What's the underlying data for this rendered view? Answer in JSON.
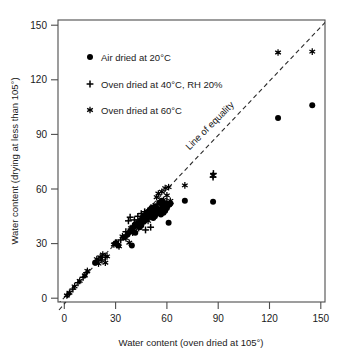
{
  "chart_data": {
    "type": "scatter",
    "title": "",
    "xlabel": "Water content (oven dried at 105°)",
    "ylabel": "Water content (drying at less than 105°)",
    "xlim": [
      0,
      150
    ],
    "ylim": [
      0,
      150
    ],
    "xticks": [
      0,
      30,
      60,
      90,
      120,
      150
    ],
    "yticks": [
      0,
      30,
      60,
      90,
      120,
      150
    ],
    "xtick_labels": [
      "0",
      "30",
      "60",
      "90",
      "120",
      "150"
    ],
    "ytick_labels": [
      "0",
      "30",
      "60",
      "90",
      "120",
      "150"
    ],
    "grid": false,
    "legend_position": "upper-left inside",
    "annotations": [
      {
        "text": "Line of equality",
        "x": 86,
        "y": 97,
        "rotation": -45,
        "name": "line-of-equality-label"
      }
    ],
    "reference_line": {
      "name": "line-of-equality",
      "style": "dashed",
      "from": [
        -4,
        -4
      ],
      "to": [
        152,
        152
      ],
      "label": "Line of equality"
    },
    "series": [
      {
        "name": "Air dried at 20°C",
        "marker": "filled-circle",
        "color": "#000000",
        "points": [
          [
            18,
            19.5
          ],
          [
            30,
            30.0
          ],
          [
            31.5,
            29.0
          ],
          [
            35,
            33.5
          ],
          [
            37,
            35.0
          ],
          [
            38.5,
            36.5
          ],
          [
            39.5,
            29.0
          ],
          [
            40,
            38.0
          ],
          [
            41,
            39.5
          ],
          [
            41.5,
            36.0
          ],
          [
            42,
            40.5
          ],
          [
            43,
            41.0
          ],
          [
            44,
            39.0
          ],
          [
            44.5,
            42.5
          ],
          [
            45,
            40.0
          ],
          [
            45.5,
            43.5
          ],
          [
            46,
            44.5
          ],
          [
            46.5,
            42.0
          ],
          [
            47,
            45.5
          ],
          [
            47.5,
            43.0
          ],
          [
            48,
            46.5
          ],
          [
            48.5,
            44.0
          ],
          [
            49,
            47.5
          ],
          [
            49.5,
            45.0
          ],
          [
            50,
            48.5
          ],
          [
            50.5,
            46.0
          ],
          [
            51,
            49.5
          ],
          [
            51.5,
            47.0
          ],
          [
            52,
            44.0
          ],
          [
            52.5,
            48.0
          ],
          [
            53,
            45.0
          ],
          [
            53.5,
            50.5
          ],
          [
            54,
            46.5
          ],
          [
            54.5,
            49.0
          ],
          [
            55,
            47.5
          ],
          [
            55.5,
            52.5
          ],
          [
            56,
            48.5
          ],
          [
            56.5,
            46.0
          ],
          [
            57,
            53.5
          ],
          [
            57.5,
            50.0
          ],
          [
            58,
            47.0
          ],
          [
            58.5,
            51.5
          ],
          [
            59,
            48.0
          ],
          [
            59.5,
            52.0
          ],
          [
            60,
            49.5
          ],
          [
            60.5,
            51.0
          ],
          [
            61,
            41.5
          ],
          [
            61.5,
            51.5
          ],
          [
            62,
            52.0
          ],
          [
            70.5,
            53.5
          ],
          [
            87,
            53.0
          ],
          [
            125,
            99.0
          ],
          [
            145,
            106.0
          ]
        ]
      },
      {
        "name": "Oven dried at 40°C, RH 20%",
        "marker": "plus",
        "color": "#000000",
        "points": [
          [
            2,
            2.0
          ],
          [
            5,
            5.0
          ],
          [
            8,
            8.5
          ],
          [
            11,
            11.5
          ],
          [
            13,
            14.0
          ],
          [
            20,
            20.5
          ],
          [
            22,
            21.0
          ],
          [
            24,
            22.5
          ],
          [
            30,
            30.5
          ],
          [
            33,
            32.0
          ],
          [
            36,
            36.5
          ],
          [
            37.5,
            42.5
          ],
          [
            38.5,
            44.5
          ],
          [
            39,
            38.0
          ],
          [
            40,
            39.5
          ],
          [
            41,
            43.0
          ],
          [
            42,
            41.5
          ],
          [
            43,
            45.0
          ],
          [
            44,
            42.0
          ],
          [
            45,
            46.5
          ],
          [
            46,
            43.5
          ],
          [
            47,
            47.5
          ],
          [
            47.5,
            37.5
          ],
          [
            48,
            44.5
          ],
          [
            49,
            48.0
          ],
          [
            50,
            45.5
          ],
          [
            50.5,
            39.0
          ],
          [
            51,
            49.0
          ],
          [
            52,
            46.5
          ],
          [
            53,
            50.0
          ],
          [
            54,
            47.0
          ],
          [
            55,
            48.5
          ],
          [
            56,
            51.5
          ],
          [
            57,
            49.5
          ],
          [
            58,
            52.5
          ],
          [
            59,
            50.5
          ],
          [
            60,
            53.0
          ],
          [
            61,
            51.0
          ],
          [
            62,
            52.0
          ],
          [
            87,
            66.5
          ],
          [
            87.2,
            68.5
          ]
        ]
      },
      {
        "name": "Oven dried at 60°C",
        "marker": "asterisk",
        "color": "#000000",
        "points": [
          [
            1.5,
            1.5
          ],
          [
            3,
            3.0
          ],
          [
            6,
            6.5
          ],
          [
            9,
            9.5
          ],
          [
            12,
            12.5
          ],
          [
            13.5,
            15.0
          ],
          [
            19,
            21.5
          ],
          [
            20,
            19.0
          ],
          [
            21,
            22.5
          ],
          [
            22.5,
            24.0
          ],
          [
            24,
            19.5
          ],
          [
            25,
            23.0
          ],
          [
            29,
            29.5
          ],
          [
            30.5,
            30.5
          ],
          [
            32,
            28.5
          ],
          [
            34,
            34.0
          ],
          [
            36,
            33.0
          ],
          [
            38,
            30.5
          ],
          [
            39,
            38.5
          ],
          [
            40,
            36.0
          ],
          [
            42,
            40.0
          ],
          [
            43.5,
            38.5
          ],
          [
            45,
            41.0
          ],
          [
            46,
            43.0
          ],
          [
            48,
            45.0
          ],
          [
            49,
            42.5
          ],
          [
            50,
            46.5
          ],
          [
            51,
            48.0
          ],
          [
            52,
            50.5
          ],
          [
            53,
            47.0
          ],
          [
            54,
            55.5
          ],
          [
            55,
            57.5
          ],
          [
            56,
            52.5
          ],
          [
            57,
            58.5
          ],
          [
            58,
            54.0
          ],
          [
            59,
            60.5
          ],
          [
            60,
            56.5
          ],
          [
            61,
            61.0
          ],
          [
            62,
            53.5
          ],
          [
            70.5,
            62.0
          ],
          [
            87,
            67.5
          ],
          [
            125,
            135.0
          ],
          [
            145,
            135.5
          ]
        ]
      }
    ]
  },
  "legend": {
    "name": "legend",
    "items": [
      {
        "label": "Air dried at 20°C",
        "marker": "filled-circle"
      },
      {
        "label": "Oven dried at 40°C, RH 20%",
        "marker": "plus"
      },
      {
        "label": "Oven dried at 60°C",
        "marker": "asterisk"
      }
    ]
  }
}
